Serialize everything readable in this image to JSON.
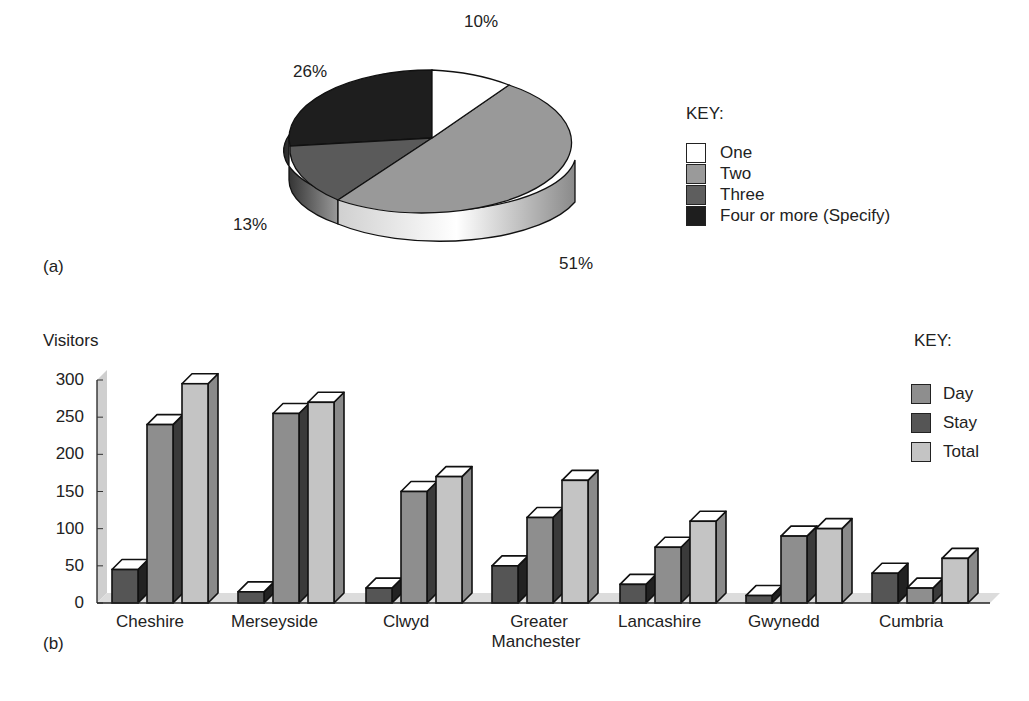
{
  "panel_a": {
    "label": "(a)",
    "key_title": "KEY:",
    "legend": [
      {
        "label": "One",
        "color": "#ffffff"
      },
      {
        "label": "Two",
        "color": "#9a9a9a"
      },
      {
        "label": "Three",
        "color": "#5e5e5e"
      },
      {
        "label": "Four or more (Specify)",
        "color": "#1e1e1e"
      }
    ],
    "slice_labels": [
      "10%",
      "51%",
      "13%",
      "26%"
    ]
  },
  "panel_b": {
    "label": "(b)",
    "ylabel": "Visitors",
    "key_title": "KEY:",
    "yticks": [
      "300",
      "250",
      "200",
      "150",
      "100",
      "50",
      "0"
    ],
    "categories": [
      "Cheshire",
      "Merseyside",
      "Clwyd",
      "Greater",
      "Lancashire",
      "Gwynedd",
      "Cumbria"
    ],
    "category_line2": [
      "",
      "",
      "",
      "Manchester",
      "",
      "",
      ""
    ],
    "legend": [
      {
        "label": "Day",
        "color": "#8e8e8e"
      },
      {
        "label": "Stay",
        "color": "#555555"
      },
      {
        "label": "Total",
        "color": "#c4c4c4"
      }
    ]
  },
  "chart_data": [
    {
      "type": "pie",
      "title": "",
      "categories": [
        "One",
        "Two",
        "Three",
        "Four or more (Specify)"
      ],
      "values": [
        10,
        51,
        13,
        26
      ],
      "unit": "%",
      "legend_title": "KEY:",
      "legend_position": "right",
      "style": "3d"
    },
    {
      "type": "bar",
      "title": "",
      "xlabel": "",
      "ylabel": "Visitors",
      "ylim": [
        0,
        300
      ],
      "yticks": [
        0,
        50,
        100,
        150,
        200,
        250,
        300
      ],
      "categories": [
        "Cheshire",
        "Merseyside",
        "Clwyd",
        "Greater Manchester",
        "Lancashire",
        "Gwynedd",
        "Cumbria"
      ],
      "series": [
        {
          "name": "Stay",
          "values": [
            45,
            15,
            20,
            50,
            25,
            10,
            40
          ]
        },
        {
          "name": "Day",
          "values": [
            240,
            255,
            150,
            115,
            75,
            90,
            20
          ]
        },
        {
          "name": "Total",
          "values": [
            295,
            270,
            170,
            165,
            110,
            100,
            60
          ]
        }
      ],
      "legend_title": "KEY:",
      "legend_position": "right",
      "grid": false,
      "style": "3d"
    }
  ]
}
